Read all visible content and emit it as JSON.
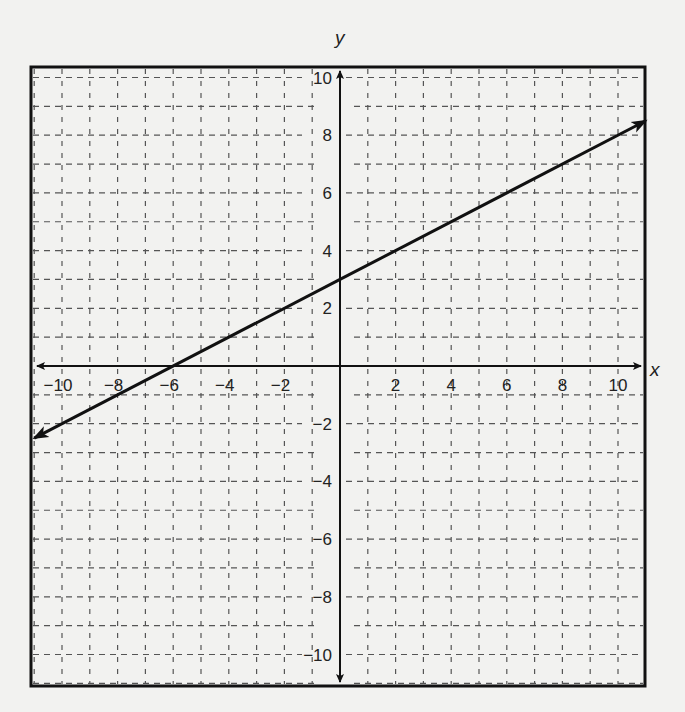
{
  "chart_data": {
    "type": "line",
    "title": "",
    "xlabel": "x",
    "ylabel": "y",
    "xlim": [
      -11,
      11
    ],
    "ylim": [
      -11,
      11
    ],
    "grid": true,
    "grid_style": "dashed",
    "grid_step": 1,
    "x_ticks": [
      -10,
      -8,
      -6,
      -4,
      -2,
      2,
      4,
      6,
      8,
      10
    ],
    "y_ticks": [
      10,
      8,
      6,
      4,
      2,
      -2,
      -4,
      -6,
      -8,
      -10
    ],
    "x_tick_labels": [
      "−10",
      "−8",
      "−6",
      "−4",
      "−2",
      "2",
      "4",
      "6",
      "8",
      "10"
    ],
    "y_tick_labels": [
      "10",
      "8",
      "6",
      "4",
      "2",
      "−2",
      "−4",
      "−6",
      "−8",
      "−10"
    ],
    "series": [
      {
        "name": "line",
        "equation": "y = 0.5x + 3",
        "slope": 0.5,
        "intercept": 3,
        "x": [
          -11,
          -6,
          0,
          2,
          11
        ],
        "y": [
          -2.5,
          0,
          3,
          4,
          8.5
        ],
        "arrows": "both"
      }
    ],
    "legend": null
  }
}
